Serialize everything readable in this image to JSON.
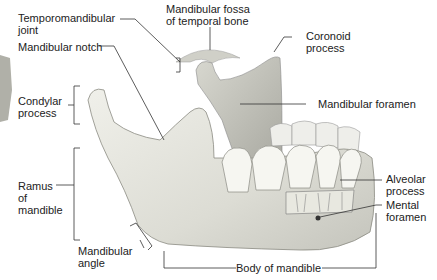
{
  "labels": {
    "tmj": [
      "Temporomandibular",
      "joint"
    ],
    "fossa": [
      "Mandibular fossa",
      "of temporal bone"
    ],
    "coronoid": [
      "Coronoid",
      "process"
    ],
    "notch": "Mandibular notch",
    "condylar": [
      "Condylar",
      "process"
    ],
    "foramen": "Mandibular foramen",
    "ramus": [
      "Ramus",
      "of",
      "mandible"
    ],
    "alveolar": [
      "Alveolar",
      "process"
    ],
    "mental": [
      "Mental",
      "foramen"
    ],
    "angle": [
      "Mandibular",
      "angle"
    ],
    "body": "Body of mandible"
  },
  "colors": {
    "bone": "#e6e6e0",
    "bone_shadow": "#b8b8b0",
    "line": "#333333",
    "tooth": "#f4f4ef"
  }
}
